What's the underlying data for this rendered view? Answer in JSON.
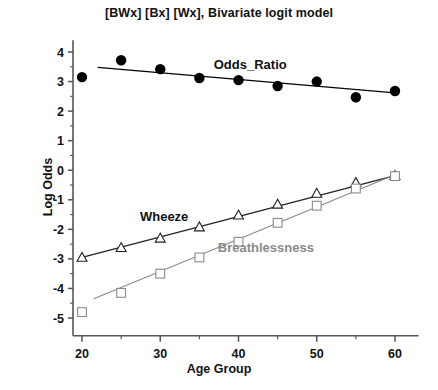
{
  "chart_data": {
    "type": "scatter",
    "title": "[BWx] [Bx] [Wx], Bivariate logit model",
    "xlabel": "Age Group",
    "ylabel": "Log Odds",
    "xlim": [
      17,
      63
    ],
    "ylim": [
      -5.6,
      4.4
    ],
    "xticks": [
      20,
      30,
      40,
      50,
      60
    ],
    "xticks_minor": [
      25,
      35,
      45,
      55
    ],
    "yticks": [
      4,
      3,
      2,
      1,
      0,
      -1,
      -2,
      -3,
      -4,
      -5
    ],
    "grid": false,
    "legend": "inline-annotations",
    "x": [
      20,
      25,
      30,
      35,
      40,
      45,
      50,
      55,
      60
    ],
    "series": [
      {
        "name": "Odds_Ratio",
        "marker": "filled-circle",
        "color": "#000000",
        "label_color": "#111111",
        "values": [
          3.15,
          3.72,
          3.42,
          3.12,
          3.05,
          2.85,
          3.0,
          2.47,
          2.68
        ],
        "fit_line": {
          "x": [
            22,
            60
          ],
          "y": [
            3.48,
            2.62
          ]
        },
        "annotation": {
          "text": "Odds_Ratio",
          "x": 41.5,
          "y": 3.42
        }
      },
      {
        "name": "Wheeze",
        "marker": "open-triangle",
        "color": "#222222",
        "label_color": "#111111",
        "values": [
          -2.95,
          -2.62,
          -2.3,
          -1.92,
          -1.52,
          -1.15,
          -0.78,
          -0.42,
          -0.18
        ],
        "fit_line": {
          "x": [
            20,
            60
          ],
          "y": [
            -2.95,
            -0.18
          ]
        },
        "annotation": {
          "text": "Wheeze",
          "x": 30.5,
          "y": -1.72
        }
      },
      {
        "name": "Breathlessness",
        "marker": "open-square",
        "color": "#8a8a8a",
        "label_color": "#8a8a8a",
        "values": [
          -4.8,
          -4.15,
          -3.5,
          -2.95,
          -2.42,
          -1.78,
          -1.2,
          -0.62,
          -0.2
        ],
        "fit_line": {
          "x": [
            21.5,
            60
          ],
          "y": [
            -4.35,
            -0.15
          ]
        },
        "annotation": {
          "text": "Breathlessness",
          "x": 43.5,
          "y": -2.78
        }
      }
    ]
  },
  "axes": {
    "spine_color": "#555555"
  }
}
